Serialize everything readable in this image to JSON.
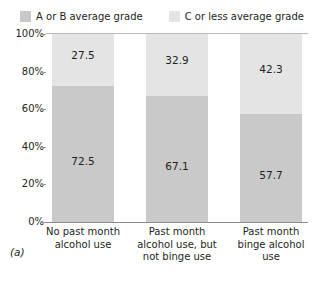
{
  "chart_data": {
    "type": "bar",
    "subtype": "stacked-100-percent",
    "title": "",
    "xlabel": "",
    "ylabel": "",
    "ylim": [
      0,
      100
    ],
    "yticks": [
      "0%",
      "20%",
      "40%",
      "60%",
      "80%",
      "100%"
    ],
    "ytick_values": [
      0,
      20,
      40,
      60,
      80,
      100
    ],
    "grid": false,
    "legend_position": "top-center",
    "categories": [
      "No past month alcohol use",
      "Past month alcohol use, but not binge use",
      "Past month binge alcohol use"
    ],
    "category_lines": [
      [
        "No past month",
        "alcohol use"
      ],
      [
        "Past month",
        "alcohol use, but",
        "not binge use"
      ],
      [
        "Past month",
        "binge alcohol",
        "use"
      ]
    ],
    "series": [
      {
        "name": "A or B average grade",
        "color": "#c9c9c9",
        "values": [
          72.5,
          67.1,
          57.7
        ],
        "labels": [
          "72.5",
          "67.1",
          "57.7"
        ]
      },
      {
        "name": "C or less average grade",
        "color": "#e4e4e4",
        "values": [
          27.5,
          32.9,
          42.3
        ],
        "labels": [
          "27.5",
          "32.9",
          "42.3"
        ]
      }
    ]
  },
  "legend": {
    "items": [
      {
        "label": "A or B average grade",
        "color": "#c9c9c9"
      },
      {
        "label": "C or less average grade",
        "color": "#e4e4e4"
      }
    ]
  },
  "caption": "(a)"
}
